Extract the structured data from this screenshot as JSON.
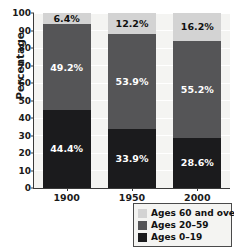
{
  "chart_data": {
    "type": "bar",
    "stacked": true,
    "title": "",
    "subtitle": "",
    "xlabel": "",
    "ylabel": "Percentage",
    "categories": [
      "1900",
      "1950",
      "2000"
    ],
    "ylim": [
      0,
      100
    ],
    "yticks": [
      0,
      10,
      20,
      30,
      40,
      50,
      60,
      70,
      80,
      90,
      100
    ],
    "ytick_labels": [
      "0",
      "10",
      "20",
      "30",
      "40",
      "50",
      "60",
      "70",
      "80",
      "90",
      "100"
    ],
    "grid": true,
    "grid_axis": "y",
    "legend_position": "below-right",
    "series": [
      {
        "name": "Ages 0–19",
        "color": "#1b1b1d",
        "values": [
          44.4,
          33.9,
          28.6
        ],
        "labels": [
          "44.4%",
          "33.9%",
          "28.6%"
        ]
      },
      {
        "name": "Ages 20–59",
        "color": "#555557",
        "values": [
          49.2,
          53.9,
          55.2
        ],
        "labels": [
          "49.2%",
          "53.9%",
          "55.2%"
        ]
      },
      {
        "name": "Ages 60 and over",
        "color": "#d3d3d3",
        "values": [
          6.4,
          12.2,
          16.2
        ],
        "labels": [
          "6.4%",
          "12.2%",
          "16.2%"
        ]
      }
    ],
    "legend_order": [
      "Ages 60 and over",
      "Ages 20–59",
      "Ages 0–19"
    ],
    "colors": {
      "ages_60_and_over": "#d3d3d3",
      "ages_20_59": "#555557",
      "ages_0_19": "#1b1b1d",
      "plot_background": "#f4f4f2",
      "gridline": "#ffffff",
      "axis": "#3a3a3a"
    }
  },
  "axis": {
    "y_title": "Percentage"
  },
  "legend": {
    "items": [
      {
        "label": "Ages 60 and over",
        "color": "#d3d3d3"
      },
      {
        "label": "Ages 20–59",
        "color": "#555557"
      },
      {
        "label": "Ages 0–19",
        "color": "#1b1b1d"
      }
    ]
  }
}
